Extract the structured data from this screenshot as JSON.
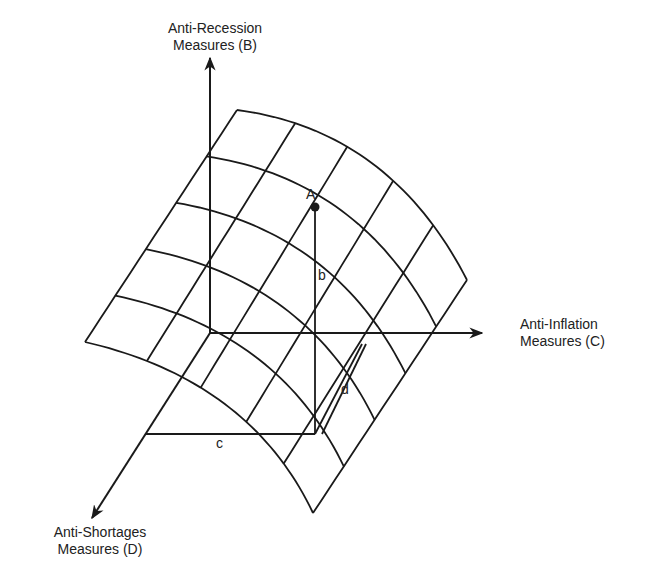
{
  "diagram": {
    "type": "3d-surface-tradeoff",
    "axes": {
      "vertical": {
        "id": "B",
        "line1": "Anti-Recession",
        "line2": "Measures (B)"
      },
      "horizontal": {
        "id": "C",
        "line1": "Anti-Inflation",
        "line2": "Measures (C)"
      },
      "depth": {
        "id": "D",
        "line1": "Anti-Shortages",
        "line2": "Measures (D)"
      }
    },
    "point": {
      "label": "A"
    },
    "projections": {
      "b": "b",
      "c": "c",
      "d": "d"
    },
    "grid": {
      "rows": 5,
      "cols": 5
    },
    "colors": {
      "ink": "#1a1a1a",
      "background": "#ffffff"
    }
  }
}
